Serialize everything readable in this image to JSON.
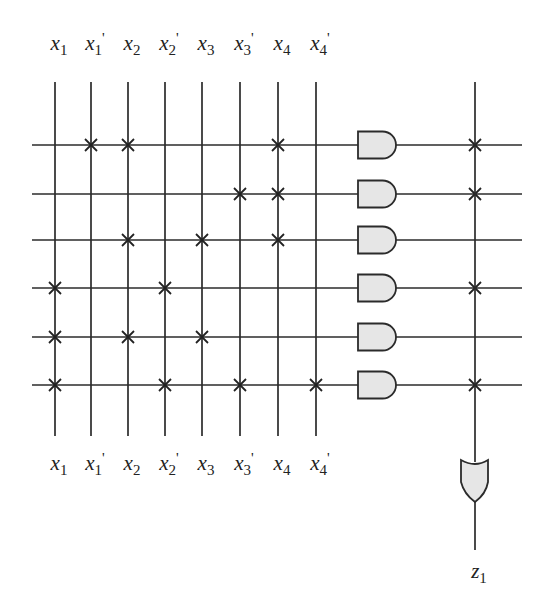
{
  "diagram": {
    "title": "",
    "type": "PLA (programmable logic array) AND-OR crosspoint diagram",
    "colors": {
      "wire": "#2b2b2b",
      "gate_fill": "#e6e6e6",
      "background": "#ffffff"
    },
    "inputs": [
      {
        "id": "x1",
        "base": "x",
        "sub": "1",
        "prime": ""
      },
      {
        "id": "x1p",
        "base": "x",
        "sub": "1",
        "prime": "'"
      },
      {
        "id": "x2",
        "base": "x",
        "sub": "2",
        "prime": ""
      },
      {
        "id": "x2p",
        "base": "x",
        "sub": "2",
        "prime": "'"
      },
      {
        "id": "x3",
        "base": "x",
        "sub": "3",
        "prime": ""
      },
      {
        "id": "x3p",
        "base": "x",
        "sub": "3",
        "prime": "'"
      },
      {
        "id": "x4",
        "base": "x",
        "sub": "4",
        "prime": ""
      },
      {
        "id": "x4p",
        "base": "x",
        "sub": "4",
        "prime": "'"
      }
    ],
    "and_terms": [
      {
        "row": 1,
        "connections": [
          "x1p",
          "x2",
          "x4"
        ],
        "to_or": true
      },
      {
        "row": 2,
        "connections": [
          "x3p",
          "x4"
        ],
        "to_or": true
      },
      {
        "row": 3,
        "connections": [
          "x2",
          "x3",
          "x4"
        ],
        "to_or": false
      },
      {
        "row": 4,
        "connections": [
          "x1",
          "x2p"
        ],
        "to_or": true
      },
      {
        "row": 5,
        "connections": [
          "x1",
          "x2",
          "x3"
        ],
        "to_or": false
      },
      {
        "row": 6,
        "connections": [
          "x1",
          "x2p",
          "x3p",
          "x4p"
        ],
        "to_or": true
      }
    ],
    "output": {
      "base": "z",
      "sub": "1"
    }
  }
}
